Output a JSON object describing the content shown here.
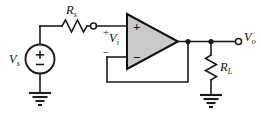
{
  "figure": {
    "background_color": "#ffffff",
    "line_color": "#1a1a1a",
    "opamp_fill_color": "#c9c9c9"
  },
  "labels": {
    "source": {
      "symbol": "V",
      "subscript": "s",
      "plus": "+",
      "minus": "−"
    },
    "series_resistor": {
      "symbol": "R",
      "subscript": "s"
    },
    "input_voltage": {
      "symbol": "V",
      "subscript": "i",
      "plus": "+",
      "minus": "−"
    },
    "opamp": {
      "noninverting": "+",
      "inverting": "−"
    },
    "output_voltage": {
      "symbol": "V",
      "subscript": "o"
    },
    "load_resistor": {
      "symbol": "R",
      "subscript": "L"
    }
  },
  "components": [
    {
      "name": "voltage-source-vs",
      "type": "independent-voltage-source",
      "label": "Vs"
    },
    {
      "name": "resistor-rs",
      "type": "resistor",
      "label": "Rs",
      "orientation": "horizontal"
    },
    {
      "name": "operational-amplifier",
      "type": "opamp",
      "configuration": "voltage-follower"
    },
    {
      "name": "resistor-rl",
      "type": "resistor",
      "label": "RL",
      "orientation": "vertical"
    },
    {
      "name": "ground-source",
      "type": "ground"
    },
    {
      "name": "ground-load",
      "type": "ground"
    },
    {
      "name": "terminal-input",
      "type": "open-terminal"
    },
    {
      "name": "terminal-output",
      "type": "open-terminal",
      "label": "Vo"
    }
  ]
}
